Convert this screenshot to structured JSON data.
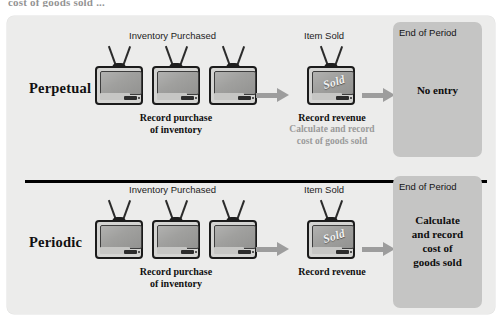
{
  "top_cut_text": "cost of goods sold ...",
  "diagram": {
    "divider": "row-divider",
    "column_headers": {
      "inventory_purchased": "Inventory Purchased",
      "item_sold": "Item Sold",
      "end_of_period": "End of Period"
    },
    "rows": [
      {
        "id": "perpetual",
        "method_label": "Perpetual",
        "inventory_header": "Inventory Purchased",
        "inventory_caption": "Record purchase\nof inventory",
        "inventory_caption_line1": "Record purchase",
        "inventory_caption_line2": "of inventory",
        "tv_count": 3,
        "item_sold_header": "Item Sold",
        "sold_badge": "Sold",
        "sold_caption_bold": "Record revenue",
        "sold_caption_gray_line1": "Calculate and record",
        "sold_caption_gray_line2": "cost of goods sold",
        "end_of_period_label": "End of Period",
        "end_of_period_text": "No entry",
        "arrow1": "arrow-right",
        "arrow2": "arrow-right"
      },
      {
        "id": "periodic",
        "method_label": "Periodic",
        "inventory_header": "Inventory Purchased",
        "inventory_caption_line1": "Record purchase",
        "inventory_caption_line2": "of inventory",
        "tv_count": 3,
        "item_sold_header": "Item Sold",
        "sold_badge": "Sold",
        "sold_caption_bold": "Record revenue",
        "sold_caption_gray_line1": "",
        "sold_caption_gray_line2": "",
        "end_of_period_label": "End of Period",
        "end_of_period_text": "Calculate\nand record\ncost of\ngoods sold",
        "end_of_period_line1": "Calculate",
        "end_of_period_line2": "and record",
        "end_of_period_line3": "cost of",
        "end_of_period_line4": "goods sold",
        "arrow1": "arrow-right",
        "arrow2": "arrow-right"
      }
    ],
    "colors": {
      "panel_background": "#ececeb",
      "end_of_period_box": "#c5c5c4",
      "arrow": "#9d9d9d",
      "gray_text": "#9a9a9a",
      "divider": "#000000",
      "tv_body": "#d4d4d2",
      "tv_screen": "#9c9c9a",
      "tv_outline": "#1b1b1b"
    }
  }
}
